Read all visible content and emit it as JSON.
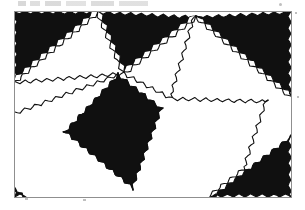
{
  "figure": {
    "title": "",
    "caption": "",
    "kind": "scanned-line-figure",
    "background_color": "#ffffff",
    "ink_color": "#101010",
    "frame_color": "#8f8f8f",
    "canvas": {
      "width": 305,
      "height": 210
    },
    "plot_frame": {
      "x": 14,
      "y": 11,
      "width": 277,
      "height": 186
    }
  },
  "chart_data": {
    "type": "diagram",
    "title": "",
    "subtitle": "",
    "xlabel": "",
    "ylabel": "",
    "legend": [],
    "annotations": [],
    "grid": false,
    "style": {
      "zigzag_period_px": 5.6,
      "zigzag_amplitude_px": 3.4,
      "stroke_width_px": 1.1,
      "fill_black": "#101010",
      "fill_white": "#ffffff"
    },
    "vertices": {
      "v_left_top": [
        14,
        11
      ],
      "v_top_a": [
        98,
        11
      ],
      "v_top_b": [
        196,
        16
      ],
      "v_right_top": [
        291,
        11
      ],
      "v_left_mid": [
        14,
        112
      ],
      "v_mid_a": [
        74,
        73
      ],
      "v_mid_b": [
        172,
        97
      ],
      "v_right_mid": [
        268,
        100
      ],
      "v_bottom_a": [
        127,
        193
      ],
      "v_bottom_b": [
        245,
        170
      ],
      "v_left_bottom": [
        14,
        197
      ],
      "v_right_bottom": [
        291,
        197
      ],
      "v_quad_top": [
        118,
        73
      ],
      "v_quad_right": [
        163,
        108
      ]
    },
    "tiles": [
      {
        "id": "t1",
        "fill": "black",
        "label": "upper-left corner triangle",
        "points": [
          [
            14,
            11
          ],
          [
            98,
            11
          ],
          [
            14,
            81
          ]
        ]
      },
      {
        "id": "t2",
        "fill": "white",
        "label": "upper-left white triangle",
        "points": [
          [
            98,
            11
          ],
          [
            14,
            81
          ],
          [
            124,
            72
          ]
        ]
      },
      {
        "id": "t3",
        "fill": "black",
        "label": "top band triangle",
        "points": [
          [
            98,
            11
          ],
          [
            196,
            16
          ],
          [
            124,
            72
          ]
        ]
      },
      {
        "id": "t4",
        "fill": "white",
        "label": "top-centre white triangle",
        "points": [
          [
            196,
            16
          ],
          [
            124,
            72
          ],
          [
            172,
            97
          ]
        ]
      },
      {
        "id": "t5",
        "fill": "black",
        "label": "upper-right corner triangle",
        "points": [
          [
            196,
            16
          ],
          [
            291,
            11
          ],
          [
            291,
            96
          ]
        ]
      },
      {
        "id": "t6",
        "fill": "white",
        "label": "right white triangle",
        "points": [
          [
            196,
            16
          ],
          [
            291,
            96
          ],
          [
            172,
            97
          ]
        ]
      },
      {
        "id": "t7",
        "fill": "black",
        "label": "large central quadrilateral",
        "points": [
          [
            118,
            73
          ],
          [
            163,
            108
          ],
          [
            133,
            190
          ],
          [
            63,
            132
          ]
        ]
      },
      {
        "id": "t8",
        "fill": "white",
        "label": "left white wedge",
        "points": [
          [
            14,
            112
          ],
          [
            118,
            73
          ],
          [
            63,
            132
          ]
        ]
      },
      {
        "id": "t9",
        "fill": "white",
        "label": "lower-left white region",
        "points": [
          [
            14,
            112
          ],
          [
            63,
            132
          ],
          [
            133,
            190
          ],
          [
            14,
            197
          ]
        ]
      },
      {
        "id": "t10",
        "fill": "white",
        "label": "lower-centre white triangle",
        "points": [
          [
            172,
            97
          ],
          [
            268,
            100
          ],
          [
            245,
            170
          ],
          [
            133,
            190
          ]
        ]
      },
      {
        "id": "t11",
        "fill": "black",
        "label": "lower-right corner triangle",
        "points": [
          [
            245,
            170
          ],
          [
            291,
            135
          ],
          [
            291,
            197
          ],
          [
            210,
            197
          ]
        ]
      },
      {
        "id": "t12",
        "fill": "white",
        "label": "right-middle white triangle",
        "points": [
          [
            268,
            100
          ],
          [
            291,
            96
          ],
          [
            291,
            135
          ],
          [
            245,
            170
          ]
        ]
      },
      {
        "id": "t13",
        "fill": "black",
        "label": "tiny bottom-left speck",
        "points": [
          [
            14,
            186
          ],
          [
            26,
            197
          ],
          [
            14,
            197
          ]
        ]
      }
    ],
    "edges": [
      {
        "id": "e1",
        "from": [
          14,
          81
        ],
        "to": [
          98,
          11
        ],
        "style": "zigzag"
      },
      {
        "id": "e2",
        "from": [
          98,
          11
        ],
        "to": [
          124,
          72
        ],
        "style": "zigzag"
      },
      {
        "id": "e3",
        "from": [
          14,
          81
        ],
        "to": [
          124,
          72
        ],
        "style": "zigzag"
      },
      {
        "id": "e4",
        "from": [
          124,
          72
        ],
        "to": [
          196,
          16
        ],
        "style": "zigzag"
      },
      {
        "id": "e5",
        "from": [
          196,
          16
        ],
        "to": [
          172,
          97
        ],
        "style": "zigzag"
      },
      {
        "id": "e6",
        "from": [
          124,
          72
        ],
        "to": [
          172,
          97
        ],
        "style": "zigzag"
      },
      {
        "id": "e7",
        "from": [
          196,
          16
        ],
        "to": [
          291,
          96
        ],
        "style": "zigzag"
      },
      {
        "id": "e8",
        "from": [
          172,
          97
        ],
        "to": [
          268,
          100
        ],
        "style": "zigzag"
      },
      {
        "id": "e9",
        "from": [
          14,
          112
        ],
        "to": [
          118,
          73
        ],
        "style": "zigzag"
      },
      {
        "id": "e10",
        "from": [
          118,
          73
        ],
        "to": [
          163,
          108
        ],
        "style": "zigzag"
      },
      {
        "id": "e11",
        "from": [
          163,
          108
        ],
        "to": [
          133,
          190
        ],
        "style": "zigzag"
      },
      {
        "id": "e12",
        "from": [
          133,
          190
        ],
        "to": [
          63,
          132
        ],
        "style": "zigzag"
      },
      {
        "id": "e13",
        "from": [
          63,
          132
        ],
        "to": [
          118,
          73
        ],
        "style": "zigzag"
      },
      {
        "id": "e14",
        "from": [
          268,
          100
        ],
        "to": [
          245,
          170
        ],
        "style": "zigzag"
      },
      {
        "id": "e15",
        "from": [
          245,
          170
        ],
        "to": [
          210,
          197
        ],
        "style": "zigzag"
      },
      {
        "id": "e16",
        "from": [
          245,
          170
        ],
        "to": [
          291,
          135
        ],
        "style": "zigzag"
      }
    ]
  },
  "artifacts": {
    "top_smudge_label": "scan-smudge",
    "specks": [
      "speck-top-right",
      "speck-right-edge",
      "speck-right-mid",
      "speck-bottom",
      "speck-bottom-left"
    ]
  }
}
